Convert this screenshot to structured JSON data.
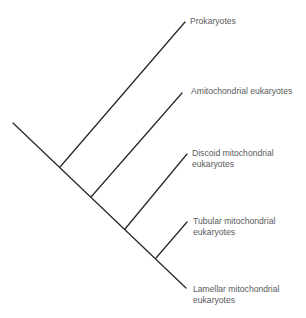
{
  "diagram": {
    "type": "cladogram",
    "colors": {
      "line": "#2a2a2a",
      "text": "#5a5a5a",
      "background": "#ffffff"
    },
    "taxa": [
      {
        "id": "prokaryotes",
        "lines": [
          "Prokaryotes"
        ]
      },
      {
        "id": "amitochondrial",
        "lines": [
          "Amitochondrial eukaryotes"
        ]
      },
      {
        "id": "discoid",
        "lines": [
          "Discoid mitochondrial",
          "eukaryotes"
        ]
      },
      {
        "id": "tubular",
        "lines": [
          "Tubular mitochondrial",
          "eukaryotes"
        ]
      },
      {
        "id": "lamellar",
        "lines": [
          "Lamellar mitochondrial",
          "eukaryotes"
        ]
      }
    ],
    "branch_order": [
      "Prokaryotes",
      "Amitochondrial eukaryotes",
      "Discoid mitochondrial eukaryotes",
      "Tubular mitochondrial eukaryotes",
      "Lamellar mitochondrial eukaryotes"
    ]
  }
}
